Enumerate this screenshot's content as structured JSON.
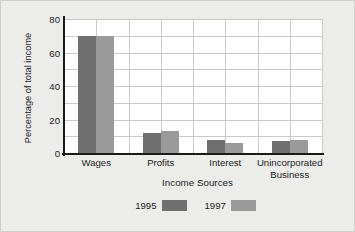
{
  "chart_data": {
    "type": "bar",
    "title": "",
    "xlabel": "Income Sources",
    "ylabel": "Percentage of total income",
    "categories": [
      "Wages",
      "Profits",
      "Interest",
      "Unincorporated Business"
    ],
    "series": [
      {
        "name": "1995",
        "color": "#6f6f6f",
        "values": [
          70,
          12,
          8,
          7
        ]
      },
      {
        "name": "1997",
        "color": "#9a9a9a",
        "values": [
          70,
          13,
          6,
          8
        ]
      }
    ],
    "ylim": [
      0,
      80
    ],
    "yticks": [
      0,
      20,
      40,
      60,
      80
    ],
    "ytick_labels": [
      "0",
      "20",
      "40",
      "60",
      "80"
    ],
    "minor_gridline_step": 10,
    "grid": true,
    "legend_position": "bottom"
  },
  "axis": {
    "y_title": "Percentage of total income",
    "x_title": "Income Sources"
  },
  "legend": {
    "items": [
      {
        "label": "1995",
        "color": "#6f6f6f"
      },
      {
        "label": "1997",
        "color": "#9a9a9a"
      }
    ]
  },
  "colors": {
    "figure_background": "#ececeb",
    "plot_background": "#ffffff",
    "gridline": "#c9c9c7",
    "axis_line": "#1a1a1a",
    "text": "#1c1c1c",
    "series_1995": "#6f6f6f",
    "series_1997": "#9a9a9a"
  }
}
